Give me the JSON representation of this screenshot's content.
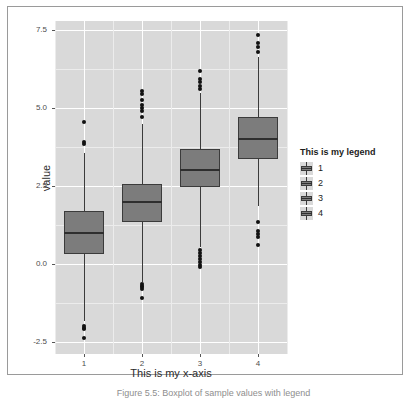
{
  "figure": {
    "caption": "Figure 5.5: Boxplot of sample values with legend",
    "background": "#ffffff",
    "panel_background": "#d9d9d9",
    "box_fill": "#7c7c7c",
    "line_color": "#3b3b3b"
  },
  "legend": {
    "title": "This is my legend",
    "items": [
      {
        "label": "1"
      },
      {
        "label": "2"
      },
      {
        "label": "3"
      },
      {
        "label": "4"
      }
    ]
  },
  "chart_data": {
    "type": "box",
    "title": "",
    "xlabel": "This is my x-axis",
    "ylabel": "value",
    "categories": [
      "1",
      "2",
      "3",
      "4"
    ],
    "legend_title": "This is my legend",
    "legend_position": "right",
    "grid": true,
    "ylim": [
      -2.9,
      7.8
    ],
    "yticks": [
      7.5,
      5.0,
      2.5,
      0.0,
      -2.5
    ],
    "ytick_labels": [
      "7.5",
      "5.0",
      "2.5",
      "0.0",
      "-2.5"
    ],
    "xticks": [
      1,
      2,
      3,
      4
    ],
    "xtick_labels": [
      "1",
      "2",
      "3",
      "4"
    ],
    "boxes": [
      {
        "group": "1",
        "q1": 0.3,
        "median": 1.0,
        "q3": 1.7,
        "whisker_low": -1.85,
        "whisker_high": 3.55,
        "outliers": [
          -2.4,
          -2.1,
          -2.05,
          -2.0,
          3.9,
          3.85,
          4.55
        ]
      },
      {
        "group": "2",
        "q1": 1.35,
        "median": 2.0,
        "q3": 2.55,
        "whisker_low": -0.6,
        "whisker_high": 4.5,
        "outliers": [
          -1.1,
          -0.8,
          -0.75,
          -0.7,
          -0.65,
          4.7,
          4.9,
          5.0,
          5.1,
          5.25,
          5.45,
          5.55
        ]
      },
      {
        "group": "3",
        "q1": 2.45,
        "median": 3.0,
        "q3": 3.7,
        "whisker_low": 0.55,
        "whisker_high": 5.5,
        "outliers": [
          -0.1,
          -0.05,
          0.05,
          0.15,
          0.25,
          0.35,
          0.45,
          5.6,
          5.7,
          5.85,
          5.95,
          6.2
        ],
        "n_outliers_low": 7,
        "n_outliers_high": 5
      },
      {
        "group": "4",
        "q1": 3.35,
        "median": 4.0,
        "q3": 4.7,
        "whisker_low": 1.85,
        "whisker_high": 6.65,
        "outliers": [
          0.6,
          0.85,
          0.95,
          1.05,
          1.35,
          6.8,
          6.95,
          7.1,
          7.35
        ],
        "n_outliers_low": 5,
        "n_outliers_high": 4
      }
    ]
  }
}
